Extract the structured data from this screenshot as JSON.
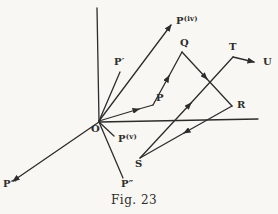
{
  "figure": {
    "caption": "Fig. 23",
    "colors": {
      "background": "#f8f7f3",
      "ink": "#2e2c2a"
    },
    "labels": {
      "o": {
        "text": "O",
        "sup": ""
      },
      "p": {
        "text": "P",
        "sup": ""
      },
      "p1": {
        "text": "P′",
        "sup": ""
      },
      "p2": {
        "text": "P″",
        "sup": ""
      },
      "p3": {
        "text": "P‴",
        "sup": ""
      },
      "p4": {
        "text": "P",
        "sup": "(iv)"
      },
      "p5": {
        "text": "P",
        "sup": "(v)"
      },
      "q": {
        "text": "Q",
        "sup": ""
      },
      "r": {
        "text": "R",
        "sup": ""
      },
      "s": {
        "text": "S",
        "sup": ""
      },
      "t": {
        "text": "T",
        "sup": ""
      },
      "u": {
        "text": "U",
        "sup": ""
      }
    }
  }
}
